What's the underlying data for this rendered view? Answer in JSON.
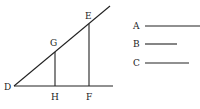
{
  "diagram": {
    "points": {
      "D": {
        "label": "D",
        "x": 14,
        "y": 86
      },
      "G": {
        "label": "G",
        "x": 55,
        "y": 52
      },
      "H": {
        "label": "H",
        "x": 55,
        "y": 86
      },
      "E": {
        "label": "E",
        "x": 89,
        "y": 24
      },
      "F": {
        "label": "F",
        "x": 89,
        "y": 86
      }
    },
    "legend": [
      {
        "label": "A",
        "length": 60
      },
      {
        "label": "B",
        "length": 32
      },
      {
        "label": "C",
        "length": 45
      }
    ],
    "line_color": "#222222"
  }
}
